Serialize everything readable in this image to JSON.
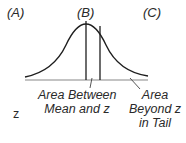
{
  "column_labels": {
    "a": "(A)",
    "b": "(B)",
    "c": "(C)"
  },
  "row_label": "z",
  "captions": {
    "between": [
      "Area Between",
      "Mean and z"
    ],
    "beyond": [
      "Area",
      "Beyond z",
      "in Tail"
    ]
  },
  "colors": {
    "line": "#1e1e1e",
    "baseline": "#888888",
    "text": "#2a2a2a"
  }
}
